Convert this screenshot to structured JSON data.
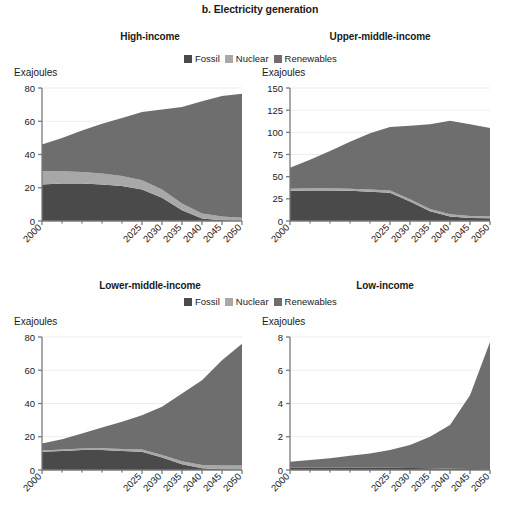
{
  "figure": {
    "title": "b. Electricity generation",
    "axis_unit_label": "Exajoules",
    "colors": {
      "fossil": "#4a4a4a",
      "nuclear": "#a8a8a8",
      "renewables": "#6e6e6e",
      "axis": "#7a7a7a",
      "grid": "#ededed",
      "text": "#1a1a1a"
    }
  },
  "legend": {
    "items": [
      {
        "label": "Fossil",
        "color": "#4a4a4a",
        "key": "fossil"
      },
      {
        "label": "Nuclear",
        "color": "#a8a8a8",
        "key": "nuclear"
      },
      {
        "label": "Renewables",
        "color": "#6e6e6e",
        "key": "renewables"
      }
    ]
  },
  "chart_data": [
    {
      "type": "area",
      "id": "high-income",
      "title": "High-income",
      "xlabel": "",
      "ylabel": "Exajoules",
      "stacked": true,
      "grid": true,
      "legend_position": "top-center",
      "x": [
        2000,
        2005,
        2010,
        2015,
        2020,
        2025,
        2030,
        2035,
        2040,
        2045,
        2050
      ],
      "xticks": [
        2000,
        2025,
        2030,
        2035,
        2040,
        2045,
        2050
      ],
      "xlim": [
        2000,
        2050
      ],
      "yticks": [
        0,
        20,
        40,
        60,
        80
      ],
      "ylim": [
        0,
        80
      ],
      "series": [
        {
          "name": "Fossil",
          "values": [
            22.0,
            22.5,
            22.5,
            22.0,
            21.0,
            19.0,
            14.0,
            6.5,
            1.5,
            0.5,
            0.2
          ]
        },
        {
          "name": "Nuclear",
          "values": [
            8.0,
            7.5,
            7.0,
            6.5,
            6.0,
            5.5,
            5.0,
            4.0,
            3.0,
            2.2,
            1.8
          ]
        },
        {
          "name": "Renewables",
          "values": [
            16.0,
            20.0,
            25.0,
            30.0,
            35.0,
            41.0,
            48.0,
            58.0,
            67.5,
            72.5,
            74.5
          ]
        }
      ],
      "totals": [
        46.0,
        50.0,
        54.5,
        58.5,
        62.0,
        65.5,
        67.0,
        68.5,
        72.0,
        75.2,
        76.5
      ]
    },
    {
      "type": "area",
      "id": "upper-middle-income",
      "title": "Upper-middle-income",
      "xlabel": "",
      "ylabel": "Exajoules",
      "stacked": true,
      "grid": true,
      "legend_position": "top-center",
      "x": [
        2000,
        2005,
        2010,
        2015,
        2020,
        2025,
        2030,
        2035,
        2040,
        2045,
        2050
      ],
      "xticks": [
        2000,
        2025,
        2030,
        2035,
        2040,
        2045,
        2050
      ],
      "xlim": [
        2000,
        2050
      ],
      "yticks": [
        0,
        25,
        50,
        75,
        100,
        125,
        150
      ],
      "ylim": [
        0,
        150
      ],
      "series": [
        {
          "name": "Fossil",
          "values": [
            34.0,
            34.5,
            34.5,
            34.0,
            33.0,
            32.0,
            22.0,
            11.0,
            5.0,
            3.5,
            3.0
          ]
        },
        {
          "name": "Nuclear",
          "values": [
            2.5,
            2.5,
            2.5,
            2.5,
            2.5,
            2.5,
            2.5,
            2.5,
            2.5,
            2.0,
            2.0
          ]
        },
        {
          "name": "Renewables",
          "values": [
            23.5,
            32.0,
            42.0,
            53.0,
            63.5,
            71.5,
            83.0,
            95.5,
            105.5,
            103.5,
            100.0
          ]
        }
      ],
      "totals": [
        60.0,
        69.0,
        79.0,
        89.5,
        99.0,
        106.0,
        107.5,
        109.0,
        113.0,
        109.0,
        105.0
      ]
    },
    {
      "type": "area",
      "id": "lower-middle-income",
      "title": "Lower-middle-income",
      "xlabel": "",
      "ylabel": "Exajoules",
      "stacked": true,
      "grid": true,
      "legend_position": "top-right",
      "x": [
        2000,
        2005,
        2010,
        2015,
        2020,
        2025,
        2030,
        2035,
        2040,
        2045,
        2050
      ],
      "xticks": [
        2000,
        2025,
        2030,
        2035,
        2040,
        2045,
        2050
      ],
      "xlim": [
        2000,
        2050
      ],
      "yticks": [
        0,
        20,
        40,
        60,
        80
      ],
      "ylim": [
        0,
        80
      ],
      "series": [
        {
          "name": "Fossil",
          "values": [
            11.0,
            11.5,
            12.0,
            12.0,
            11.5,
            11.0,
            7.5,
            3.5,
            1.0,
            0.5,
            0.3
          ]
        },
        {
          "name": "Nuclear",
          "values": [
            0.8,
            0.9,
            1.0,
            1.1,
            1.2,
            1.3,
            1.5,
            1.8,
            2.0,
            2.2,
            2.4
          ]
        },
        {
          "name": "Renewables",
          "values": [
            4.2,
            6.1,
            9.0,
            12.4,
            16.3,
            20.7,
            29.0,
            40.7,
            51.0,
            63.3,
            73.3
          ]
        }
      ],
      "totals": [
        16.0,
        18.5,
        22.0,
        25.5,
        29.0,
        33.0,
        38.0,
        46.0,
        54.0,
        66.0,
        76.0
      ]
    },
    {
      "type": "area",
      "id": "low-income",
      "title": "Low-income",
      "xlabel": "",
      "ylabel": "Exajoules",
      "stacked": true,
      "grid": true,
      "legend_position": "top-left",
      "x": [
        2000,
        2005,
        2010,
        2015,
        2020,
        2025,
        2030,
        2035,
        2040,
        2045,
        2050
      ],
      "xticks": [
        2000,
        2025,
        2030,
        2035,
        2040,
        2045,
        2050
      ],
      "xlim": [
        2000,
        2050
      ],
      "yticks": [
        0,
        2,
        4,
        6,
        8
      ],
      "ylim": [
        0,
        8
      ],
      "series": [
        {
          "name": "Fossil",
          "values": [
            0.15,
            0.15,
            0.15,
            0.15,
            0.14,
            0.13,
            0.12,
            0.1,
            0.08,
            0.06,
            0.05
          ]
        },
        {
          "name": "Nuclear",
          "values": [
            0.0,
            0.0,
            0.0,
            0.0,
            0.0,
            0.0,
            0.0,
            0.0,
            0.0,
            0.0,
            0.0
          ]
        },
        {
          "name": "Renewables",
          "values": [
            0.35,
            0.45,
            0.55,
            0.7,
            0.86,
            1.07,
            1.38,
            1.9,
            2.62,
            4.44,
            7.65
          ]
        }
      ],
      "totals": [
        0.5,
        0.6,
        0.7,
        0.85,
        1.0,
        1.2,
        1.5,
        2.0,
        2.7,
        4.5,
        7.7
      ]
    }
  ]
}
